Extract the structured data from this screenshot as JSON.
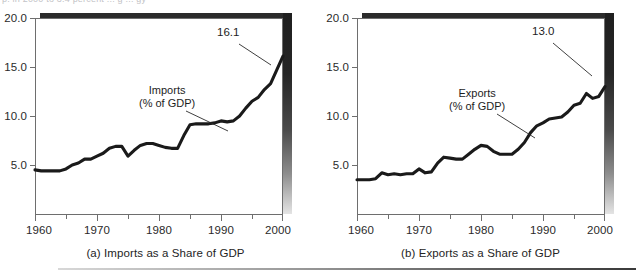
{
  "figure": {
    "clipped_top_text": "p. in 2000 to 3.4 percent ... g ... gy",
    "panels": [
      {
        "id": "imports",
        "caption": "(a) Imports as a Share of GDP",
        "series_label_line1": "Imports",
        "series_label_line2": "(% of GDP)",
        "end_value_label": "16.1"
      },
      {
        "id": "exports",
        "caption": "(b) Exports as a Share of GDP",
        "series_label_line1": "Exports",
        "series_label_line2": "(% of GDP)",
        "end_value_label": "13.0"
      }
    ]
  },
  "chart_data": [
    {
      "type": "line",
      "title": "(a) Imports as a Share of GDP",
      "xlabel": "",
      "ylabel": "",
      "xlim": [
        1960,
        2000
      ],
      "ylim": [
        0,
        20
      ],
      "grid": false,
      "legend": "annotation",
      "xticks": [
        1960,
        1965,
        1970,
        1975,
        1980,
        1985,
        1990,
        1995,
        2000
      ],
      "xticklabels": [
        "1960",
        "",
        "1970",
        "",
        "1980",
        "",
        "1990",
        "",
        "2000"
      ],
      "yticks": [
        5.0,
        10.0,
        15.0,
        20.0
      ],
      "yticklabels": [
        "5.0",
        "10.0",
        "15.0",
        "20.0"
      ],
      "annotations": [
        {
          "text": "Imports\n(% of GDP)",
          "x": 1981,
          "y": 13.4
        },
        {
          "text": "16.1",
          "x": 1995.5,
          "y": 17.9
        }
      ],
      "series": [
        {
          "name": "Imports (% of GDP)",
          "color": "#1a1a1a",
          "x": [
            1960,
            1961,
            1962,
            1963,
            1964,
            1965,
            1966,
            1967,
            1968,
            1969,
            1970,
            1971,
            1972,
            1973,
            1974,
            1975,
            1976,
            1977,
            1978,
            1979,
            1980,
            1981,
            1982,
            1983,
            1984,
            1985,
            1986,
            1987,
            1988,
            1989,
            1990,
            1991,
            1992,
            1993,
            1994,
            1995,
            1996,
            1997,
            1998,
            1999,
            2000
          ],
          "values": [
            4.5,
            4.4,
            4.4,
            4.4,
            4.4,
            4.6,
            5.0,
            5.2,
            5.6,
            5.6,
            5.9,
            6.2,
            6.7,
            6.9,
            6.9,
            5.9,
            6.5,
            7.0,
            7.2,
            7.2,
            7.0,
            6.8,
            6.7,
            6.7,
            8.0,
            9.1,
            9.2,
            9.2,
            9.2,
            9.3,
            9.5,
            9.4,
            9.5,
            10.0,
            10.8,
            11.5,
            11.9,
            12.7,
            13.3,
            14.7,
            16.1
          ]
        }
      ]
    },
    {
      "type": "line",
      "title": "(b) Exports as a Share of GDP",
      "xlabel": "",
      "ylabel": "",
      "xlim": [
        1960,
        2000
      ],
      "ylim": [
        0,
        20
      ],
      "grid": false,
      "legend": "annotation",
      "xticks": [
        1960,
        1965,
        1970,
        1975,
        1980,
        1985,
        1990,
        1995,
        2000
      ],
      "xticklabels": [
        "1960",
        "",
        "1970",
        "",
        "1980",
        "",
        "1990",
        "",
        "2000"
      ],
      "yticks": [
        5.0,
        10.0,
        15.0,
        20.0
      ],
      "yticklabels": [
        "5.0",
        "10.0",
        "15.0",
        "20.0"
      ],
      "annotations": [
        {
          "text": "Exports\n(% of GDP)",
          "x": 1980.5,
          "y": 13.2
        },
        {
          "text": "13.0",
          "x": 1993.5,
          "y": 15.3
        }
      ],
      "series": [
        {
          "name": "Exports (% of GDP)",
          "color": "#1a1a1a",
          "x": [
            1960,
            1961,
            1962,
            1963,
            1964,
            1965,
            1966,
            1967,
            1968,
            1969,
            1970,
            1971,
            1972,
            1973,
            1974,
            1975,
            1976,
            1977,
            1978,
            1979,
            1980,
            1981,
            1982,
            1983,
            1984,
            1985,
            1986,
            1987,
            1988,
            1989,
            1990,
            1991,
            1992,
            1993,
            1994,
            1995,
            1996,
            1997,
            1998,
            1999,
            2000
          ],
          "values": [
            3.5,
            3.5,
            3.5,
            3.6,
            4.2,
            4.0,
            4.1,
            4.0,
            4.1,
            4.1,
            4.6,
            4.2,
            4.3,
            5.2,
            5.8,
            5.7,
            5.6,
            5.6,
            6.1,
            6.6,
            7.0,
            6.9,
            6.4,
            6.1,
            6.1,
            6.1,
            6.6,
            7.3,
            8.3,
            9.0,
            9.3,
            9.7,
            9.8,
            9.9,
            10.4,
            11.1,
            11.3,
            12.3,
            11.8,
            12.0,
            13.0
          ]
        }
      ]
    }
  ]
}
